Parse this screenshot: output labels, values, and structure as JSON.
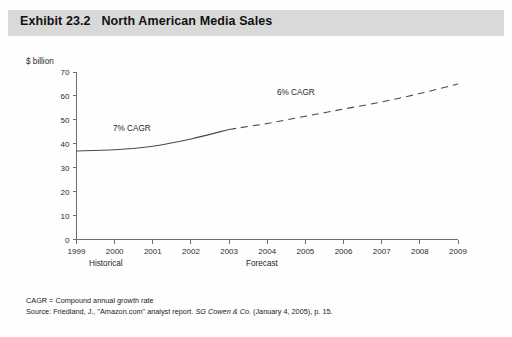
{
  "exhibit": {
    "title": "Exhibit 23.2   North American Media Sales"
  },
  "axes": {
    "y_unit_label": "$ billion",
    "y_ticks": [
      "70",
      "60",
      "50",
      "40",
      "30",
      "20",
      "10",
      "0"
    ],
    "x_ticks": [
      "1999",
      "2000",
      "2001",
      "2002",
      "2003",
      "2004",
      "2005",
      "2006",
      "2007",
      "2008",
      "2009"
    ]
  },
  "annotations": {
    "historical_cagr": "7% CAGR",
    "forecast_cagr": "6% CAGR"
  },
  "periods": {
    "historical": "Historical",
    "forecast": "Forecast"
  },
  "footnotes": {
    "cagr_definition": "CAGR = Compound annual growth rate",
    "source_prefix": "Source: Friedland, J., \"Amazon.com\" analyst report. ",
    "source_italic": "SG Cowen & Co.",
    "source_suffix": " (January 4, 2005), p. 15."
  },
  "colors": {
    "title_band": "#d9d9d9",
    "series": "#4a4a4a",
    "axis": "#6e6e6e",
    "page": "#fefefe"
  },
  "chart_data": {
    "type": "line",
    "title": "Exhibit 23.2   North American Media Sales",
    "xlabel": "",
    "ylabel": "$ billion",
    "ylim": [
      0,
      70
    ],
    "xlim": [
      "1999",
      "2009"
    ],
    "grid": false,
    "legend": "none",
    "x": [
      "1999",
      "2000",
      "2001",
      "2002",
      "2003",
      "2004",
      "2005",
      "2006",
      "2007",
      "2008",
      "2009"
    ],
    "series": [
      {
        "name": "Historical",
        "style": "solid",
        "x": [
          "1999",
          "2000",
          "2001",
          "2002",
          "2003"
        ],
        "values": [
          37,
          37.5,
          39,
          42,
          46
        ]
      },
      {
        "name": "Forecast",
        "style": "dashed",
        "x": [
          "2003",
          "2004",
          "2005",
          "2006",
          "2007",
          "2008",
          "2009"
        ],
        "values": [
          46,
          48.5,
          51.5,
          54.5,
          57.5,
          61,
          65
        ]
      }
    ],
    "annotations": [
      {
        "text": "7% CAGR",
        "x": "2000",
        "y": 48
      },
      {
        "text": "6% CAGR",
        "x": "2005",
        "y": 60
      }
    ]
  }
}
